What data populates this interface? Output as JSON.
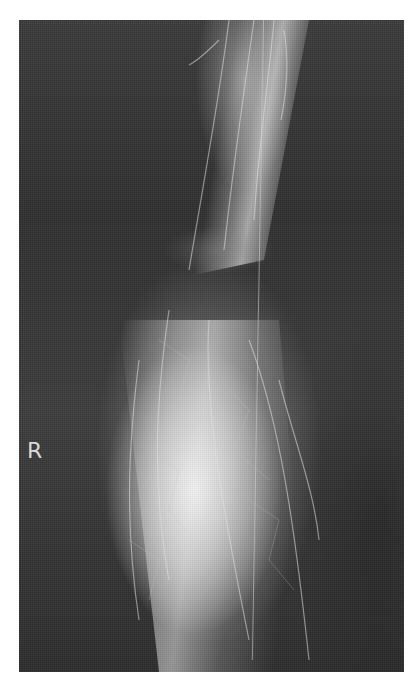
{
  "image": {
    "description": "Grayscale angiographic X-ray of a leg with contrast-filled vessels",
    "laterality_marker": "R",
    "colors": {
      "border": "#ffffff",
      "background": "#2a2a2a",
      "highlight": "#e8e8e8"
    }
  }
}
